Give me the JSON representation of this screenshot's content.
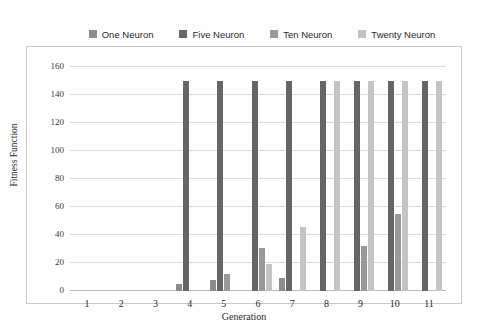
{
  "chart_data": {
    "type": "bar",
    "title": "",
    "xlabel": "Generation",
    "ylabel": "Fitness Function",
    "categories": [
      "1",
      "2",
      "3",
      "4",
      "5",
      "6",
      "7",
      "8",
      "9",
      "10",
      "11"
    ],
    "ylim": [
      0,
      160
    ],
    "ytick_labels": [
      "0",
      "20",
      "40",
      "60",
      "80",
      "100",
      "120",
      "140",
      "160"
    ],
    "ytick_values": [
      0,
      20,
      40,
      60,
      80,
      100,
      120,
      140,
      160
    ],
    "grid": true,
    "legend_position": "top",
    "series": [
      {
        "name": "One Neuron",
        "color": "#8c8c8c",
        "values": [
          0,
          0,
          0,
          5,
          8,
          0,
          9,
          0,
          0,
          0,
          0
        ]
      },
      {
        "name": "Five Neuron",
        "color": "#666666",
        "values": [
          0,
          0,
          0,
          150,
          150,
          150,
          150,
          150,
          150,
          150,
          150
        ]
      },
      {
        "name": "Ten Neuron",
        "color": "#999999",
        "values": [
          0,
          0,
          0,
          0,
          12,
          31,
          0,
          0,
          32,
          55,
          0
        ]
      },
      {
        "name": "Twenty Neuron",
        "color": "#c4c4c4",
        "values": [
          0,
          0,
          0,
          0,
          0,
          19,
          46,
          150,
          150,
          150,
          150
        ]
      }
    ]
  }
}
